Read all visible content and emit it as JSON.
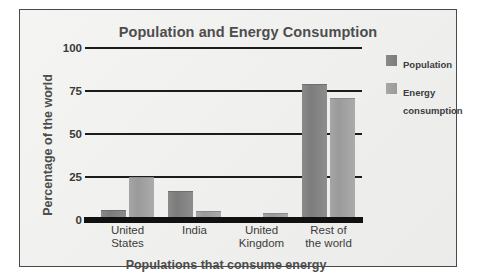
{
  "chart_data": {
    "type": "bar",
    "title": "Population and Energy Consumption",
    "xlabel": "Populations that consume energy",
    "ylabel": "Percentage of the world",
    "categories": [
      "United\nStates",
      "India",
      "United\nKingdom",
      "Rest of\nthe world"
    ],
    "series": [
      {
        "name": "Population",
        "values": [
          6,
          17,
          2,
          79
        ],
        "color": "#7f7f7f"
      },
      {
        "name": "Energy\nconsumption",
        "values": [
          25,
          5,
          4,
          71
        ],
        "color": "#a0a0a0"
      }
    ],
    "ylim": [
      0,
      100
    ],
    "yticks": [
      0,
      25,
      50,
      75,
      100
    ],
    "ytick_labels": [
      "0",
      "25",
      "50",
      "75",
      "100"
    ],
    "grid": true,
    "legend_position": "right"
  },
  "figure": {
    "panel_background": "#f2f2f0",
    "frame_color": "#4a4a4a",
    "axis_color": "#1c1c1c",
    "title_color": "#4d4d4d"
  }
}
